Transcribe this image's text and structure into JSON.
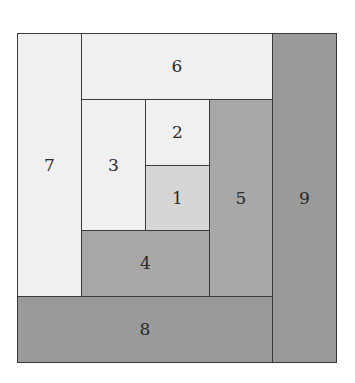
{
  "colors": {
    "light": "#f0f0f0",
    "center": "#d6d6d6",
    "medium": "#a8a8a8",
    "dark": "#9a9a9a",
    "line": "#3a3a3a"
  },
  "patches": [
    {
      "label": "1",
      "x": 128,
      "y": 132,
      "w": 64,
      "h": 65,
      "color": "#d6d6d6"
    },
    {
      "label": "2",
      "x": 128,
      "y": 66,
      "w": 64,
      "h": 66,
      "color": "#f0f0f0"
    },
    {
      "label": "3",
      "x": 64,
      "y": 66,
      "w": 64,
      "h": 131,
      "color": "#f0f0f0"
    },
    {
      "label": "4",
      "x": 64,
      "y": 197,
      "w": 128,
      "h": 66,
      "color": "#a8a8a8"
    },
    {
      "label": "5",
      "x": 192,
      "y": 66,
      "w": 63,
      "h": 197,
      "color": "#a8a8a8"
    },
    {
      "label": "6",
      "x": 64,
      "y": 0,
      "w": 191,
      "h": 66,
      "color": "#f0f0f0"
    },
    {
      "label": "7",
      "x": 0,
      "y": 0,
      "w": 64,
      "h": 263,
      "color": "#f0f0f0"
    },
    {
      "label": "8",
      "x": 0,
      "y": 263,
      "w": 255,
      "h": 66,
      "color": "#9a9a9a"
    },
    {
      "label": "9",
      "x": 255,
      "y": 0,
      "w": 64,
      "h": 329,
      "color": "#9a9a9a"
    }
  ]
}
